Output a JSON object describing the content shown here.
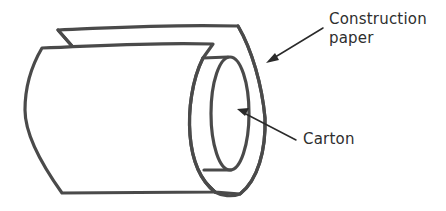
{
  "diagram": {
    "labels": {
      "construction_paper_line1": "Construction",
      "construction_paper_line2": "paper",
      "carton": "Carton"
    },
    "colors": {
      "outline": "#4a4a4a",
      "text": "#2e2e2e",
      "background": "#ffffff"
    },
    "callouts": [
      {
        "label": "Construction paper",
        "from": [
          323,
          28
        ],
        "to": [
          267,
          62
        ]
      },
      {
        "label": "Carton",
        "from": [
          296,
          140
        ],
        "to": [
          238,
          110
        ]
      }
    ]
  }
}
